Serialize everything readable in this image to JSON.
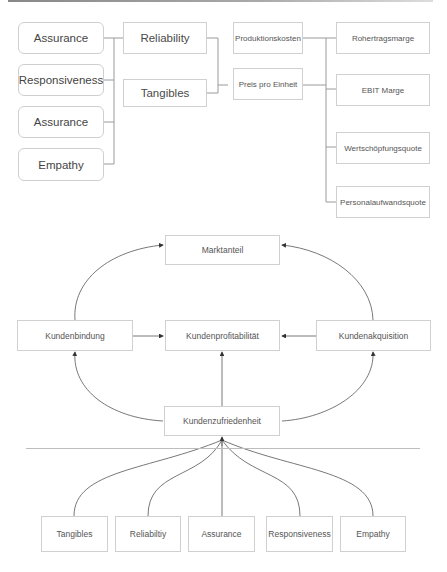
{
  "diagram_1": {
    "left_column": [
      "Assurance",
      "Responsiveness",
      "Assurance",
      "Empathy"
    ],
    "middle_column": [
      "Reliability",
      "Tangibles"
    ],
    "cost_nodes": [
      "Produktionskosten",
      "Preis pro Einheit"
    ],
    "kpi_nodes": [
      "Rohertragsmarge",
      "EBIT Marge",
      "Wertschöpfungsquote",
      "Personalaufwandsquote"
    ]
  },
  "diagram_2": {
    "top": "Marktanteil",
    "left": "Kundenbindung",
    "center": "Kundenprofitabilität",
    "right": "Kundenakquisition",
    "bottom": "Kundenzufriedenheit"
  },
  "diagram_3": {
    "drivers": [
      "Tangibles",
      "Reliabiltiy",
      "Assurance",
      "Responsiveness",
      "Empathy"
    ]
  },
  "colors": {
    "line": "#8a8a8a",
    "border": "#d0d0d0",
    "text": "#444444"
  }
}
